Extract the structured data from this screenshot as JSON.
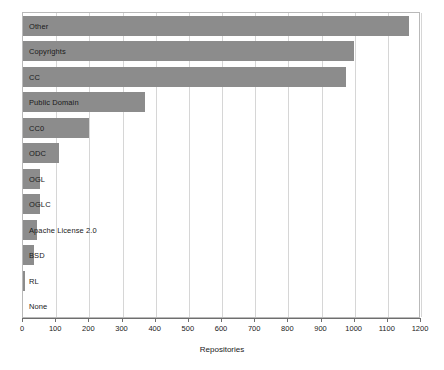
{
  "chart_data": {
    "type": "bar",
    "orientation": "horizontal",
    "title": "",
    "xlabel": "Repositories",
    "ylabel": "",
    "xlim": [
      0,
      1200
    ],
    "ylim": null,
    "grid": true,
    "legend": null,
    "bar_color": "#8c8c8c",
    "xticks": [
      0,
      100,
      200,
      300,
      400,
      500,
      600,
      700,
      800,
      900,
      1000,
      1100,
      1200
    ],
    "xticklabels": [
      "0",
      "100",
      "200",
      "300",
      "400",
      "500",
      "600",
      "700",
      "800",
      "900",
      "1000",
      "1100",
      "1200"
    ],
    "categories": [
      "Other",
      "Copyrights",
      "CC",
      "Public Domain",
      "CC0",
      "ODC",
      "OGL",
      "OGLC",
      "Apache License 2.0",
      "BSD",
      "RL",
      "None"
    ],
    "values": [
      1163,
      997,
      973,
      368,
      200,
      108,
      52,
      50,
      42,
      33,
      5,
      0
    ]
  }
}
